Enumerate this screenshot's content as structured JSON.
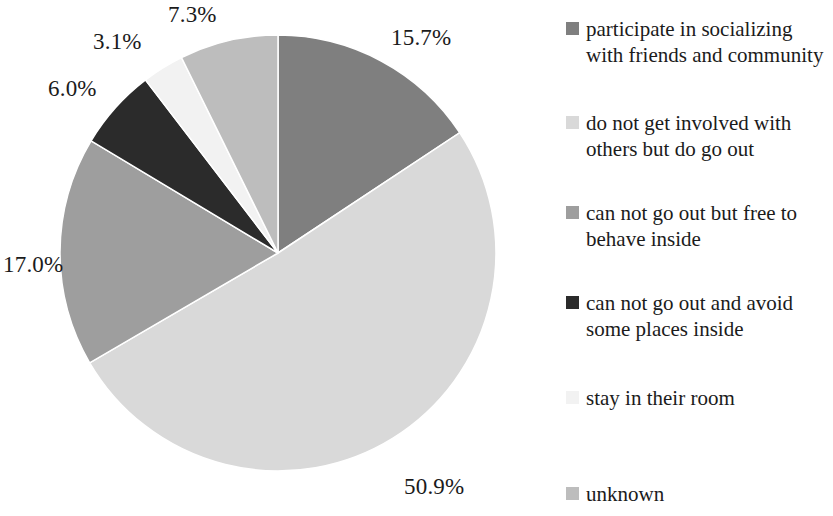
{
  "chart_data": {
    "type": "pie",
    "title": "",
    "subtitle": "",
    "xlabel": "",
    "ylabel": "",
    "legend_position": "right",
    "grid": false,
    "start_angle_deg": 0,
    "direction": "clockwise",
    "categories": [
      "participate in socializing with friends and community",
      "do not get involved with others but do go out",
      "can not go out but free to behave inside",
      "can not go out and avoid some places inside",
      "stay in their room",
      "unknown"
    ],
    "values": [
      15.7,
      50.9,
      17.0,
      6.0,
      3.1,
      7.3
    ],
    "value_labels": [
      "15.7%",
      "50.9%",
      "17.0%",
      "6.0%",
      "3.1%",
      "7.3%"
    ],
    "colors": [
      "#7f7f7f",
      "#d9d9d9",
      "#9e9e9e",
      "#2b2b2b",
      "#f2f2f2",
      "#bdbdbd"
    ],
    "slices": [
      {
        "label": "participate in socializing with friends and community",
        "value": 15.7,
        "value_label": "15.7%",
        "color": "#7f7f7f",
        "start_deg": 0,
        "end_deg": 56.52
      },
      {
        "label": "do not get involved with others but do go out",
        "value": 50.9,
        "value_label": "50.9%",
        "color": "#d9d9d9",
        "start_deg": 56.52,
        "end_deg": 239.76
      },
      {
        "label": "can not go out but free to behave inside",
        "value": 17.0,
        "value_label": "17.0%",
        "color": "#9e9e9e",
        "start_deg": 239.76,
        "end_deg": 300.96
      },
      {
        "label": "can not go out and avoid some places inside",
        "value": 6.0,
        "value_label": "6.0%",
        "color": "#2b2b2b",
        "start_deg": 300.96,
        "end_deg": 322.56
      },
      {
        "label": "stay in their room",
        "value": 3.1,
        "value_label": "3.1%",
        "color": "#f2f2f2",
        "start_deg": 322.56,
        "end_deg": 333.72
      },
      {
        "label": "unknown",
        "value": 7.3,
        "value_label": "7.3%",
        "color": "#bdbdbd",
        "start_deg": 333.72,
        "end_deg": 360.0
      }
    ]
  },
  "pie": {
    "center_x": 278,
    "center_y": 253,
    "radius": 218,
    "labels": [
      {
        "text": "15.7%",
        "left": 391,
        "top": 25
      },
      {
        "text": "50.9%",
        "left": 404,
        "top": 474
      },
      {
        "text": "17.0%",
        "left": 3,
        "top": 252
      },
      {
        "text": "6.0%",
        "left": 48,
        "top": 76
      },
      {
        "text": "3.1%",
        "left": 93,
        "top": 29
      },
      {
        "text": "7.3%",
        "left": 168,
        "top": 2
      }
    ]
  },
  "legend": {
    "items": [
      {
        "label": "participate in socializing with friends and community",
        "color": "#7f7f7f",
        "top": 16
      },
      {
        "label": "do not get involved with others but do go out",
        "color": "#d9d9d9",
        "top": 110
      },
      {
        "label": "can not go out but free to behave inside",
        "color": "#9e9e9e",
        "top": 200
      },
      {
        "label": "can not go out and avoid some places inside",
        "color": "#2b2b2b",
        "top": 290
      },
      {
        "label": "stay in their room",
        "color": "#f2f2f2",
        "top": 385
      },
      {
        "label": "unknown",
        "color": "#bdbdbd",
        "top": 481
      }
    ]
  }
}
